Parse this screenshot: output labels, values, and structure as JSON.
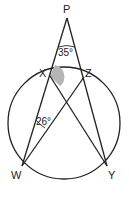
{
  "diagram": {
    "points": {
      "P": {
        "label": "P",
        "x": 67,
        "y": 18
      },
      "X": {
        "label": "X",
        "x": 50,
        "y": 76
      },
      "Z": {
        "label": "Z",
        "x": 84,
        "y": 77
      },
      "W": {
        "label": "W",
        "x": 22,
        "y": 166
      },
      "Y": {
        "label": "Y",
        "x": 107,
        "y": 166
      }
    },
    "circle": {
      "cx": 64,
      "cy": 123,
      "r": 56
    },
    "angles": {
      "at_P": {
        "label": "35°"
      },
      "at_W": {
        "label": "26°"
      },
      "at_X_shaded": {
        "color": "#b5b5b5"
      }
    },
    "colors": {
      "stroke": "#222222",
      "shade": "#b5b5b5"
    }
  }
}
